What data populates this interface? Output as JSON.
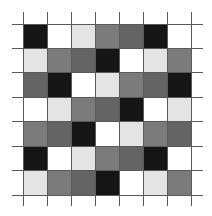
{
  "palette": {
    "K": "#151515",
    "W": "#ffffff",
    "L": "#e4e4e4",
    "M": "#7b7b7b",
    "D": "#646464"
  },
  "grid": {
    "rows": 7,
    "cols": 7,
    "cells": [
      [
        "K",
        "W",
        "L",
        "M",
        "D",
        "K",
        "W"
      ],
      [
        "L",
        "M",
        "D",
        "K",
        "W",
        "L",
        "M"
      ],
      [
        "D",
        "K",
        "W",
        "L",
        "M",
        "D",
        "K"
      ],
      [
        "W",
        "L",
        "M",
        "D",
        "K",
        "W",
        "L"
      ],
      [
        "M",
        "D",
        "K",
        "W",
        "L",
        "M",
        "D"
      ],
      [
        "K",
        "W",
        "L",
        "M",
        "D",
        "K",
        "W"
      ],
      [
        "L",
        "M",
        "D",
        "K",
        "W",
        "L",
        "M"
      ]
    ]
  },
  "lines": {
    "vertical_x": [
      23,
      47,
      71,
      95,
      119,
      143,
      167,
      191
    ],
    "horizontal_y": [
      24,
      48,
      72,
      97,
      121,
      146,
      170,
      195
    ]
  }
}
